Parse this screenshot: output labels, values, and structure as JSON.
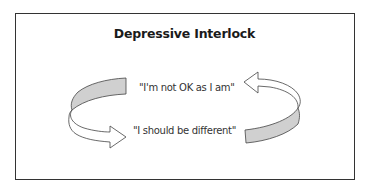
{
  "diagram": {
    "title": "Depressive Interlock",
    "statements": [
      {
        "text": "\"I'm not OK as I am\""
      },
      {
        "text": "\"I should be different\""
      }
    ],
    "colors": {
      "frame": "#333333",
      "arrow_stroke": "#444444",
      "arrow_fill_shaded": "#d0d0d0",
      "arrow_fill_light": "#ffffff",
      "text": "#333333"
    },
    "arrows": [
      {
        "direction": "left-to-bottom-right",
        "points_to": 1
      },
      {
        "direction": "right-to-top-left",
        "points_to": 0
      }
    ]
  }
}
